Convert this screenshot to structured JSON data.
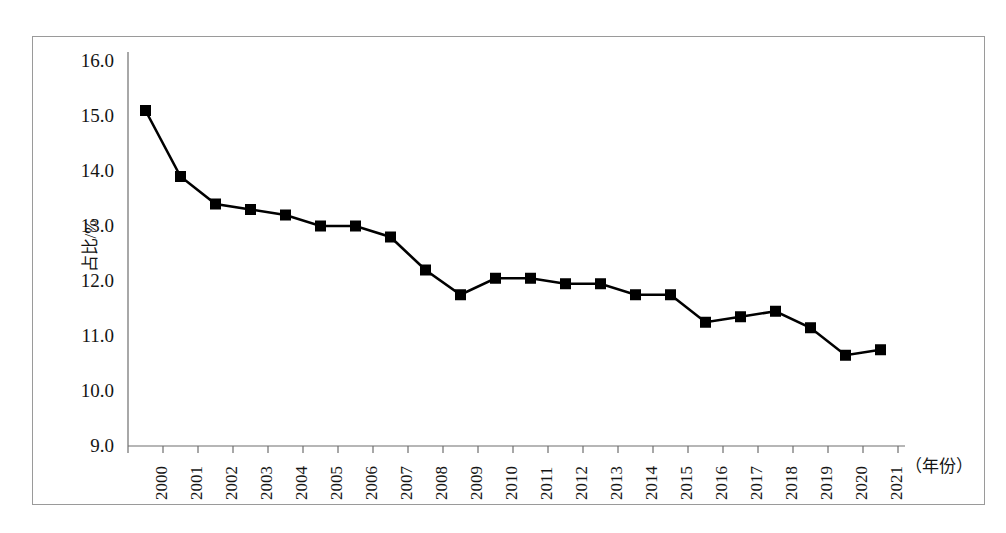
{
  "chart_data": {
    "type": "line",
    "title": "",
    "xlabel": "（年份）",
    "ylabel": "占比/%",
    "categories": [
      "2000",
      "2001",
      "2002",
      "2003",
      "2004",
      "2005",
      "2006",
      "2007",
      "2008",
      "2009",
      "2010",
      "2011",
      "2012",
      "2013",
      "2014",
      "2015",
      "2016",
      "2017",
      "2018",
      "2019",
      "2020",
      "2021"
    ],
    "values": [
      15.1,
      13.9,
      13.4,
      13.3,
      13.2,
      13.0,
      13.0,
      12.8,
      12.2,
      11.75,
      12.05,
      12.05,
      11.95,
      11.95,
      11.75,
      11.75,
      11.25,
      11.35,
      11.45,
      11.15,
      10.65,
      10.75
    ],
    "series": [
      {
        "name": "占比/%",
        "values": [
          15.1,
          13.9,
          13.4,
          13.3,
          13.2,
          13.0,
          13.0,
          12.8,
          12.2,
          11.75,
          12.05,
          12.05,
          11.95,
          11.95,
          11.75,
          11.75,
          11.25,
          11.35,
          11.45,
          11.15,
          10.65,
          10.75
        ],
        "marker": "square",
        "marker_color": "#000000",
        "line_color": "#000000"
      }
    ],
    "ylim": [
      9.0,
      16.0
    ],
    "ytick_labels": [
      "16.0",
      "15.0",
      "14.0",
      "13.0",
      "12.0",
      "11.0",
      "10.0",
      "9.0"
    ],
    "ytick_values": [
      16.0,
      15.0,
      14.0,
      13.0,
      12.0,
      11.0,
      10.0,
      9.0
    ],
    "ytick_step": 1.0,
    "grid": false,
    "legend": false,
    "legend_position": "none",
    "axis_color": "#6e6e6e",
    "frame_color": "#9a9a9a",
    "background": "#ffffff"
  },
  "axes": {
    "y_title": "占比/%",
    "x_caption": "（年份）"
  }
}
